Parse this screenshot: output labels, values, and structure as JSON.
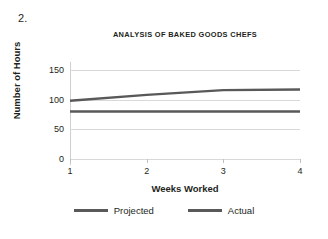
{
  "item_number": "2.",
  "chart_data": {
    "type": "line",
    "title": "ANALYSIS OF BAKED GOODS CHEFS",
    "xlabel": "Weeks Worked",
    "ylabel": "Number of Hours",
    "x": [
      1,
      2,
      3,
      4
    ],
    "xticklabels": [
      "1",
      "2",
      "3",
      "4"
    ],
    "yticks": [
      0,
      50,
      100,
      150
    ],
    "yticklabels": [
      "0",
      "50",
      "100",
      "150"
    ],
    "ylim": [
      0,
      160
    ],
    "xlim": [
      1,
      4
    ],
    "grid": "horizontal",
    "legend_position": "bottom",
    "series": [
      {
        "name": "Projected",
        "values": [
          98,
          108,
          116,
          117
        ],
        "color": "#595959"
      },
      {
        "name": "Actual",
        "values": [
          80,
          80,
          80,
          80
        ],
        "color": "#595959"
      }
    ]
  },
  "colors": {
    "line": "#595959",
    "gridline": "#d9d9d9",
    "axis": "#d0d0d0",
    "text": "#231f20",
    "background": "#ffffff"
  }
}
